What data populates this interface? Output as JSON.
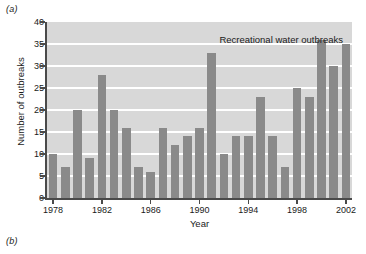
{
  "figure": {
    "panel_a_label": "(a)",
    "panel_b_label": "(b)"
  },
  "chart_data": {
    "type": "bar",
    "title": "Recreational water outbreaks",
    "xlabel": "Year",
    "ylabel": "Number of outbreaks",
    "ylim": [
      0,
      40
    ],
    "ytick_values": [
      0,
      5,
      10,
      15,
      20,
      25,
      30,
      35,
      40
    ],
    "ytick_labels": [
      "0",
      "5",
      "10",
      "15",
      "20",
      "25",
      "30",
      "35",
      "40"
    ],
    "xtick_labels": [
      "1978",
      "1982",
      "1986",
      "1990",
      "1994",
      "1998",
      "2002"
    ],
    "xtick_values": [
      1978,
      1982,
      1986,
      1990,
      1994,
      1998,
      2002
    ],
    "xlim": [
      1977.5,
      2002.5
    ],
    "grid": "horizontal-white",
    "legend": "none",
    "categories": [
      1978,
      1979,
      1980,
      1981,
      1982,
      1983,
      1984,
      1985,
      1986,
      1987,
      1988,
      1989,
      1990,
      1991,
      1992,
      1993,
      1994,
      1995,
      1996,
      1997,
      1998,
      1999,
      2000,
      2001,
      2002
    ],
    "values": [
      10,
      7,
      20,
      9,
      28,
      20,
      16,
      7,
      6,
      16,
      12,
      14,
      16,
      33,
      10,
      14,
      14,
      23,
      14,
      7,
      25,
      23,
      36,
      30,
      35
    ],
    "colors": {
      "bar": "#8a8a8a",
      "plot_background": "#d8d8d8",
      "gridline": "#ffffff",
      "axis": "#4a4a4a",
      "text": "#1a1a1a",
      "page_background": "#ffffff"
    }
  }
}
